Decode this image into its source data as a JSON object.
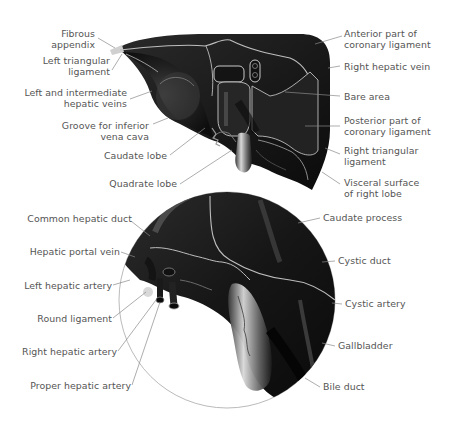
{
  "colors": {
    "organ_fill": "#1c1c1c",
    "organ_dark": "#0e0e0e",
    "organ_highlight": "#4a4a4a",
    "vessel_outline": "#bdbdbd",
    "leader_line": "#8a8a8a",
    "label_text": "#555555",
    "background": "#ffffff"
  },
  "top_view": {
    "title": "Liver - posterior/visceral view",
    "labels_left": [
      {
        "id": "fibrous-appendix",
        "lines": [
          "Fibrous",
          "appendix"
        ]
      },
      {
        "id": "left-triangular-ligament",
        "lines": [
          "Left triangular",
          "ligament"
        ]
      },
      {
        "id": "left-intermediate-hepatic-veins",
        "lines": [
          "Left and intermediate",
          "hepatic veins"
        ]
      },
      {
        "id": "groove-ivc",
        "lines": [
          "Groove for inferior",
          "vena cava"
        ]
      },
      {
        "id": "caudate-lobe",
        "lines": [
          "Caudate lobe"
        ]
      },
      {
        "id": "quadrate-lobe",
        "lines": [
          "Quadrate lobe"
        ]
      }
    ],
    "labels_right": [
      {
        "id": "anterior-coronary-ligament",
        "lines": [
          "Anterior part of",
          "coronary ligament"
        ]
      },
      {
        "id": "right-hepatic-vein",
        "lines": [
          "Right hepatic vein"
        ]
      },
      {
        "id": "bare-area",
        "lines": [
          "Bare area"
        ]
      },
      {
        "id": "posterior-coronary-ligament",
        "lines": [
          "Posterior part of",
          "coronary ligament"
        ]
      },
      {
        "id": "right-triangular-ligament",
        "lines": [
          "Right triangular",
          "ligament"
        ]
      },
      {
        "id": "visceral-surface-right-lobe",
        "lines": [
          "Visceral surface",
          "of right lobe"
        ]
      }
    ]
  },
  "bottom_view": {
    "title": "Magnified porta hepatis",
    "labels_left": [
      {
        "id": "common-hepatic-duct",
        "lines": [
          "Common hepatic duct"
        ]
      },
      {
        "id": "hepatic-portal-vein",
        "lines": [
          "Hepatic portal vein"
        ]
      },
      {
        "id": "left-hepatic-artery",
        "lines": [
          "Left hepatic artery"
        ]
      },
      {
        "id": "round-ligament",
        "lines": [
          "Round ligament"
        ]
      },
      {
        "id": "right-hepatic-artery",
        "lines": [
          "Right hepatic artery"
        ]
      },
      {
        "id": "proper-hepatic-artery",
        "lines": [
          "Proper hepatic artery"
        ]
      }
    ],
    "labels_right": [
      {
        "id": "caudate-process",
        "lines": [
          "Caudate process"
        ]
      },
      {
        "id": "cystic-duct",
        "lines": [
          "Cystic duct"
        ]
      },
      {
        "id": "cystic-artery",
        "lines": [
          "Cystic artery"
        ]
      },
      {
        "id": "gallbladder",
        "lines": [
          "Gallbladder"
        ]
      },
      {
        "id": "bile-duct",
        "lines": [
          "Bile duct"
        ]
      }
    ]
  }
}
